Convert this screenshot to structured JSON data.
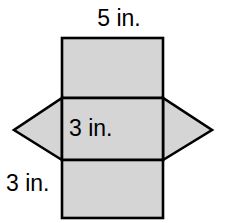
{
  "figure": {
    "name": "net-of-triangular-prism",
    "background_color": "#ffffff",
    "face_fill_color": "#d5d5d5",
    "face_stroke_color": "#000000",
    "labels": {
      "top": "5 in.",
      "middle": "3 in.",
      "bottom_left": "3 in."
    },
    "geometry": {
      "rect_left_x": 62,
      "rect_right_x": 163,
      "top_rect": {
        "x": 62,
        "y": 38,
        "width": 101,
        "height": 60
      },
      "middle_rect": {
        "x": 62,
        "y": 98,
        "width": 101,
        "height": 62
      },
      "bottom_rect": {
        "x": 62,
        "y": 160,
        "width": 101,
        "height": 58
      },
      "left_triangle": {
        "points": "62,98 62,160 14,130"
      },
      "right_triangle": {
        "points": "163,98 163,160 212,130"
      }
    }
  }
}
